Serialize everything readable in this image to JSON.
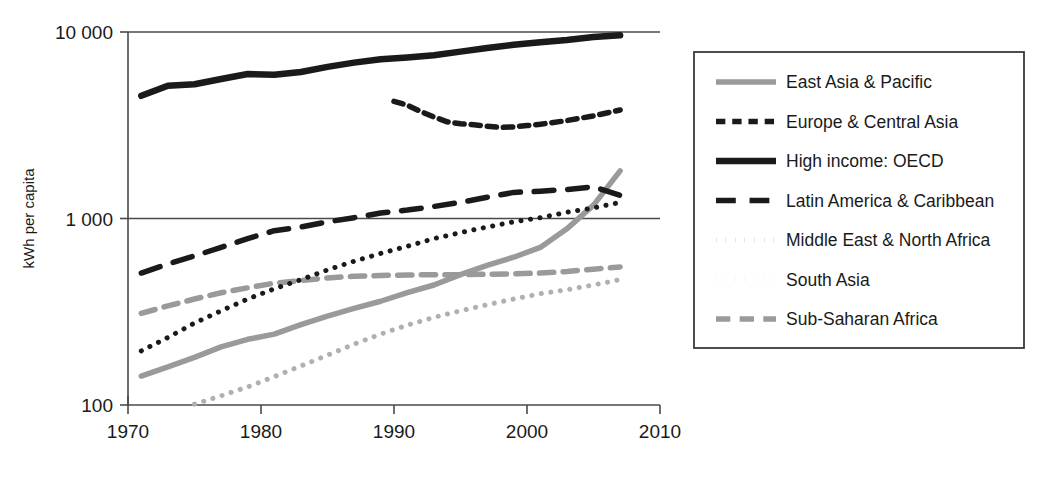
{
  "chart_data": {
    "type": "line",
    "title": "",
    "xlabel": "",
    "ylabel": "kWh per capita",
    "yscale": "log",
    "ylim": [
      100,
      10000
    ],
    "xlim": [
      1970,
      2010
    ],
    "grid": "horizontal gridlines at 1 000 and 10 000",
    "legend_position": "right, outside plot, bordered box",
    "yticks": [
      "100",
      "1 000",
      "10 000"
    ],
    "ytick_values": [
      100,
      1000,
      10000
    ],
    "xticks": [
      "1970",
      "1980",
      "1990",
      "2000",
      "2010"
    ],
    "xtick_values": [
      1970,
      1980,
      1990,
      2000,
      2010
    ],
    "series": [
      {
        "name": "East Asia & Pacific",
        "color": "#9a9a9a",
        "style": "solid",
        "width": 5.5,
        "x": [
          1971,
          1973,
          1975,
          1977,
          1979,
          1981,
          1983,
          1985,
          1987,
          1989,
          1991,
          1993,
          1995,
          1997,
          1999,
          2001,
          2003,
          2005,
          2007
        ],
        "values": [
          143,
          160,
          180,
          205,
          225,
          240,
          270,
          300,
          330,
          360,
          400,
          440,
          500,
          560,
          620,
          700,
          880,
          1180,
          1800
        ]
      },
      {
        "name": "Europe & Central Asia",
        "color": "#1a1a1a",
        "style": "short-dash",
        "width": 5.5,
        "x": [
          1990,
          1991,
          1992,
          1993,
          1994,
          1995,
          1996,
          1997,
          1998,
          1999,
          2000,
          2001,
          2003,
          2005,
          2007
        ],
        "values": [
          4250,
          4050,
          3750,
          3500,
          3300,
          3220,
          3180,
          3120,
          3080,
          3100,
          3150,
          3200,
          3350,
          3550,
          3820
        ]
      },
      {
        "name": "High income: OECD",
        "color": "#1a1a1a",
        "style": "solid",
        "width": 6.5,
        "x": [
          1971,
          1973,
          1975,
          1977,
          1979,
          1981,
          1983,
          1985,
          1987,
          1989,
          1991,
          1993,
          1995,
          1997,
          1999,
          2001,
          2003,
          2005,
          2007
        ],
        "values": [
          4550,
          5150,
          5250,
          5600,
          5950,
          5900,
          6100,
          6500,
          6850,
          7150,
          7300,
          7500,
          7850,
          8200,
          8550,
          8800,
          9050,
          9400,
          9600
        ]
      },
      {
        "name": "Latin America & Caribbean",
        "color": "#1a1a1a",
        "style": "long-dash",
        "width": 5.5,
        "x": [
          1971,
          1973,
          1975,
          1977,
          1979,
          1981,
          1983,
          1985,
          1987,
          1989,
          1991,
          1993,
          1995,
          1997,
          1999,
          2001,
          2003,
          2005,
          2007
        ],
        "values": [
          510,
          570,
          630,
          700,
          780,
          860,
          900,
          960,
          1010,
          1070,
          1110,
          1160,
          1220,
          1300,
          1380,
          1400,
          1430,
          1480,
          1330
        ]
      },
      {
        "name": "Middle East & North Africa",
        "color": "#1a1a1a",
        "style": "dotted",
        "width": 5.0,
        "x": [
          1971,
          1973,
          1975,
          1977,
          1979,
          1981,
          1983,
          1985,
          1987,
          1989,
          1991,
          1993,
          1995,
          1997,
          1999,
          2001,
          2003,
          2005,
          2007
        ],
        "values": [
          195,
          230,
          275,
          320,
          370,
          420,
          470,
          530,
          590,
          650,
          710,
          780,
          840,
          900,
          960,
          1010,
          1080,
          1140,
          1220
        ]
      },
      {
        "name": "South Asia",
        "color": "#b0b0b0",
        "style": "dotted",
        "width": 5.0,
        "x": [
          1975,
          1977,
          1979,
          1981,
          1983,
          1985,
          1987,
          1989,
          1991,
          1993,
          1995,
          1997,
          1999,
          2001,
          2003,
          2005,
          2007
        ],
        "values": [
          101,
          112,
          125,
          142,
          162,
          185,
          212,
          240,
          268,
          295,
          320,
          345,
          370,
          395,
          415,
          440,
          470
        ]
      },
      {
        "name": "Sub-Saharan Africa",
        "color": "#9a9a9a",
        "style": "medium-dash",
        "width": 5.5,
        "x": [
          1971,
          1973,
          1975,
          1977,
          1979,
          1981,
          1983,
          1985,
          1987,
          1989,
          1991,
          1993,
          1995,
          1997,
          1999,
          2001,
          2003,
          2005,
          2007
        ],
        "values": [
          310,
          340,
          370,
          400,
          425,
          450,
          465,
          480,
          490,
          495,
          498,
          500,
          500,
          502,
          505,
          510,
          520,
          535,
          550
        ]
      }
    ]
  },
  "legend": {
    "items": [
      {
        "label": "East Asia & Pacific"
      },
      {
        "label": "Europe & Central Asia"
      },
      {
        "label": "High income: OECD"
      },
      {
        "label": "Latin America & Caribbean"
      },
      {
        "label": "Middle East & North Africa"
      },
      {
        "label": "South Asia"
      },
      {
        "label": "Sub-Saharan Africa"
      }
    ]
  },
  "axes": {
    "y_axis_title": "kWh per capita",
    "y_tick_labels": [
      "10 000",
      "1 000",
      "100"
    ],
    "x_tick_labels": [
      "1970",
      "1980",
      "1990",
      "2000",
      "2010"
    ]
  }
}
